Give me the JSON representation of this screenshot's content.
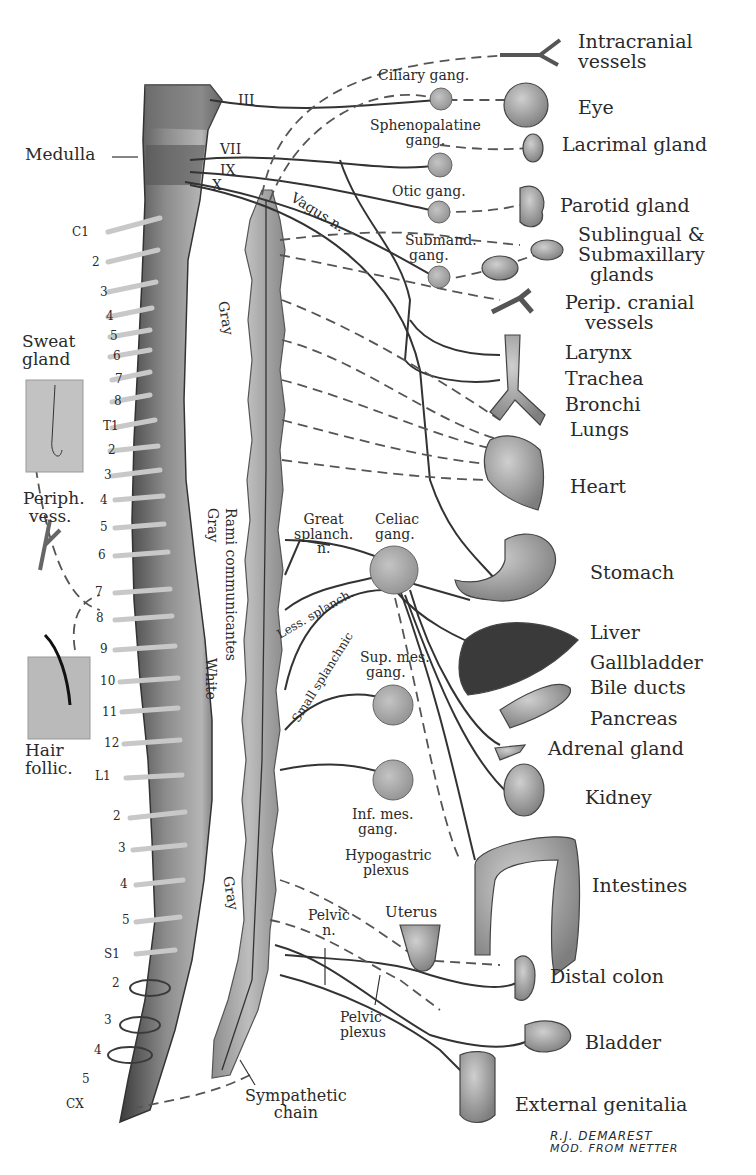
{
  "diagram": {
    "type": "anatomical",
    "colors": {
      "background": "#ffffff",
      "ink": "#2a2a2a",
      "tissue": "#9a9a9a",
      "tissue_dark": "#555555",
      "ganglion": "#a8a8a8"
    }
  },
  "cranial_nerves": [
    "III",
    "VII",
    "IX",
    "X"
  ],
  "left_labels": {
    "medulla": "Medulla",
    "sweat_gland": [
      "Sweat",
      "gland"
    ],
    "periph_vess": [
      "Periph.",
      "vess."
    ],
    "hair_follic": [
      "Hair",
      "follic."
    ]
  },
  "segments": {
    "cervical": [
      "C1",
      "2",
      "3",
      "4",
      "5",
      "6",
      "7",
      "8"
    ],
    "thoracic": [
      "T1",
      "2",
      "3",
      "4",
      "5",
      "6",
      "7",
      "8",
      "9",
      "10",
      "11",
      "12"
    ],
    "lumbar": [
      "L1",
      "2",
      "3",
      "4",
      "5"
    ],
    "sacral": [
      "S1",
      "2",
      "3",
      "4",
      "5"
    ],
    "coccygeal": [
      "CX"
    ]
  },
  "ganglia": {
    "ciliary": "Ciliary gang.",
    "sphenopalatine": [
      "Sphenopalatine",
      "gang."
    ],
    "otic": "Otic gang.",
    "submand": [
      "Submand.",
      "gang."
    ],
    "celiac": [
      "Celiac",
      "gang."
    ],
    "sup_mes": [
      "Sup. mes.",
      "gang."
    ],
    "inf_mes": [
      "Inf. mes.",
      "gang."
    ]
  },
  "nerves": {
    "vagus": "Vagus n.",
    "great_splanch": [
      "Great",
      "splanch.",
      "n."
    ],
    "less_splanch": "Less. splanch.",
    "small_splanchnic": "Small splanchnic",
    "pelvic_n": [
      "Pelvic",
      "n."
    ],
    "hypogastric": [
      "Hypogastric",
      "plexus"
    ],
    "pelvic_plexus": [
      "Pelvic",
      "plexus"
    ],
    "sympathetic_chain": [
      "Sympathetic",
      "chain"
    ],
    "rami": "Rami communicantes",
    "gray_top": "Gray",
    "gray_mid": "Gray",
    "white": "White",
    "gray_low": "Gray"
  },
  "organs": [
    {
      "id": "intracranial",
      "label": [
        "Intracranial",
        "vessels"
      ]
    },
    {
      "id": "eye",
      "label": [
        "Eye"
      ]
    },
    {
      "id": "lacrimal",
      "label": [
        "Lacrimal gland"
      ]
    },
    {
      "id": "parotid",
      "label": [
        "Parotid gland"
      ]
    },
    {
      "id": "sublingual",
      "label": [
        "Sublingual &",
        "Submaxillary",
        "glands"
      ]
    },
    {
      "id": "perip_cranial",
      "label": [
        "Perip. cranial",
        "vessels"
      ]
    },
    {
      "id": "larynx",
      "label": [
        "Larynx"
      ]
    },
    {
      "id": "trachea",
      "label": [
        "Trachea"
      ]
    },
    {
      "id": "bronchi",
      "label": [
        "Bronchi"
      ]
    },
    {
      "id": "lungs",
      "label": [
        "Lungs"
      ]
    },
    {
      "id": "heart",
      "label": [
        "Heart"
      ]
    },
    {
      "id": "stomach",
      "label": [
        "Stomach"
      ]
    },
    {
      "id": "liver",
      "label": [
        "Liver"
      ]
    },
    {
      "id": "gallbladder",
      "label": [
        "Gallbladder"
      ]
    },
    {
      "id": "bile_ducts",
      "label": [
        "Bile ducts"
      ]
    },
    {
      "id": "pancreas",
      "label": [
        "Pancreas"
      ]
    },
    {
      "id": "adrenal",
      "label": [
        "Adrenal gland"
      ]
    },
    {
      "id": "kidney",
      "label": [
        "Kidney"
      ]
    },
    {
      "id": "intestines",
      "label": [
        "Intestines"
      ]
    },
    {
      "id": "uterus",
      "label": [
        "Uterus"
      ]
    },
    {
      "id": "distal_colon",
      "label": [
        "Distal colon"
      ]
    },
    {
      "id": "bladder",
      "label": [
        "Bladder"
      ]
    },
    {
      "id": "external_genitalia",
      "label": [
        "External genitalia"
      ]
    }
  ],
  "signature": [
    "R.J. DEMAREST",
    "MOD. FROM NETTER"
  ]
}
